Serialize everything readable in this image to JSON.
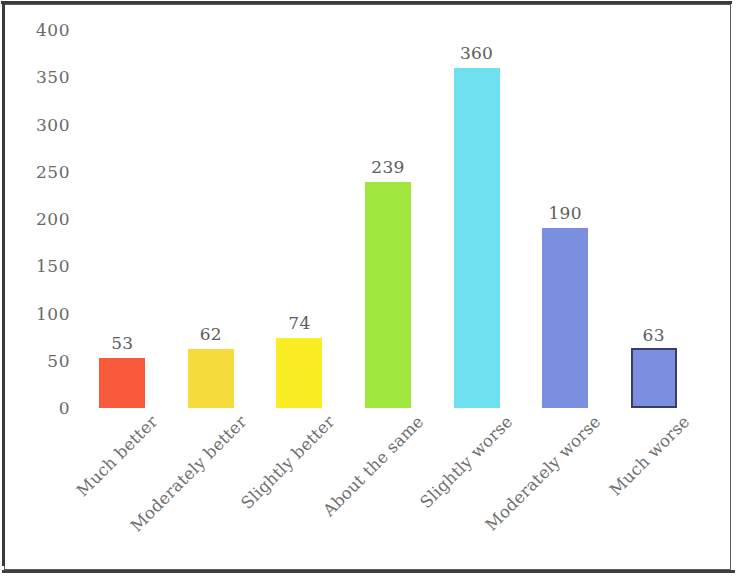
{
  "chart_data": {
    "type": "bar",
    "title": "",
    "subtitle": "",
    "xlabel": "",
    "ylabel": "",
    "ylim": [
      0,
      400
    ],
    "yticks": [
      400,
      350,
      300,
      250,
      200,
      150,
      100,
      50,
      0
    ],
    "grid": false,
    "legend": false,
    "categories": [
      "Much better",
      "Moderately better",
      "Slightly better",
      "About the same",
      "Slightly worse",
      "Moderately worse",
      "Much worse"
    ],
    "values": [
      53,
      62,
      74,
      239,
      360,
      190,
      63
    ],
    "bar_colors": [
      "#fa5a3c",
      "#f5dc3c",
      "#fbed24",
      "#a0e840",
      "#6fe0f0",
      "#7b8fe0",
      "#7b8fe0"
    ],
    "bar_outlines": [
      "none",
      "none",
      "none",
      "none",
      "none",
      "none",
      "#3c3c64"
    ],
    "value_label_color": "#5d5d5d",
    "tick_label_color": "#6a6a6a",
    "frame_color": "#3a3a3a",
    "background": "#ffffff"
  }
}
